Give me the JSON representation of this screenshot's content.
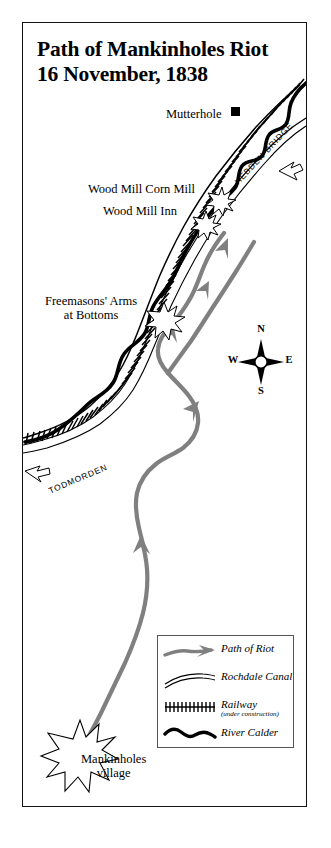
{
  "title": {
    "line1": "Path of Mankinholes Riot",
    "line2": "16 November, 1838"
  },
  "map_labels": {
    "mutterhole": "Mutterhole",
    "wood_mill_corn_mill": "Wood Mill Corn Mill",
    "wood_mill_inn": "Wood Mill Inn",
    "freemasons_line1": "Freemasons' Arms",
    "freemasons_line2": "at Bottoms",
    "mankinholes_line1": "Mankinholes",
    "mankinholes_line2": "village"
  },
  "direction_labels": {
    "hebden_bridge": "HEBDEN BRIDGE",
    "todmorden": "TODMORDEN"
  },
  "compass": {
    "north": "N",
    "south": "S",
    "east": "E",
    "west": "W"
  },
  "legend": {
    "items": [
      {
        "label": "Path of Riot",
        "sublabel": "",
        "symbol": "riot-path-arrow"
      },
      {
        "label": "Rochdale Canal",
        "sublabel": "",
        "symbol": "canal-double-line"
      },
      {
        "label": "Railway",
        "sublabel": "(under construction)",
        "symbol": "railway-hatched-line"
      },
      {
        "label": "River Calder",
        "sublabel": "",
        "symbol": "river-wavy-line"
      }
    ]
  },
  "colors": {
    "riot_path": "#808080",
    "ink": "#000000",
    "frame": "#111111",
    "legend_border": "#555555",
    "paper": "#ffffff"
  }
}
